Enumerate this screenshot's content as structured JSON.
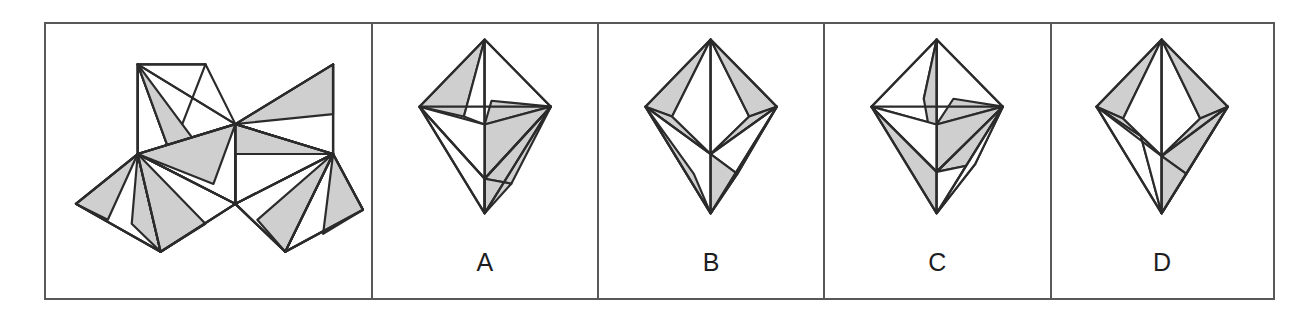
{
  "question": {
    "type": "spatial-reasoning-net-folding",
    "panel_count": 5,
    "stimulus_panel_label": "",
    "option_labels": [
      "A",
      "B",
      "C",
      "D"
    ]
  },
  "style": {
    "frame_border_color": "#57585a",
    "shape_stroke_color": "#2b2b2b",
    "shaded_face_fill": "#cfcfcf",
    "blank_face_fill": "#ffffff",
    "background": "#ffffff",
    "label_color": "#1d1d1f"
  },
  "net": {
    "name": "octahedron-net",
    "description": "Unfolded net of an octahedron made of eight triangular faces, each face sub-divided into shaded and unshaded sub-triangles",
    "outline_points": "108,62 185,30 240,95 295,30 352,95 296,160 352,225 240,225 185,160 128,225 68,160 128,95",
    "faces": [
      {
        "id": "f1",
        "points": "108,62 185,30 128,95",
        "shaded": true
      },
      {
        "id": "f2",
        "points": "108,62 128,95 185,30",
        "shaded": false
      }
    ]
  },
  "options": [
    {
      "id": "A",
      "label": "A",
      "name": "option-a-octahedron",
      "description": "Octahedron view with large shaded band across the middle and shaded upper-left face"
    },
    {
      "id": "B",
      "label": "B",
      "name": "option-b-octahedron",
      "description": "Octahedron view with shaded left and right upper faces and white central wedge"
    },
    {
      "id": "C",
      "label": "C",
      "name": "option-c-octahedron",
      "description": "Octahedron view with wide shaded horizontal band and white upper-left face"
    },
    {
      "id": "D",
      "label": "D",
      "name": "option-d-octahedron",
      "description": "Octahedron view with shaded outer faces flanking a white vertical centre"
    }
  ]
}
